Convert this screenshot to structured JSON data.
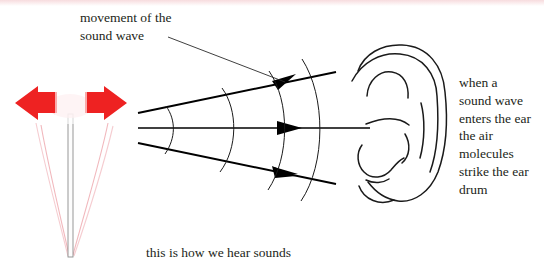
{
  "page": {
    "width": 544,
    "height": 277,
    "background": "#ffffff"
  },
  "labels": {
    "movement_line1": "movement of the",
    "movement_line2": "sound wave",
    "ear_text": "when a\nsound wave\nenters the ear\nthe air\nmolecules\nstrike the ear\ndrum",
    "caption": "this is how we hear sounds"
  },
  "colors": {
    "ink": "#231f20",
    "line": "#000000",
    "arrow_red": "#ee2222",
    "fork_prong": "#f0a8ae",
    "fork_stem": "#9a9a9a",
    "top_fade": "#f0bec3"
  },
  "elements": {
    "tuning_fork_name": "tuning-fork",
    "vibration_arrows_name": "vibration-arrows",
    "sound_wave_rays_name": "sound-wave-rays",
    "wavefront_arcs_name": "wavefront-arcs",
    "ear_name": "ear-illustration",
    "leader_name": "leader-line"
  }
}
